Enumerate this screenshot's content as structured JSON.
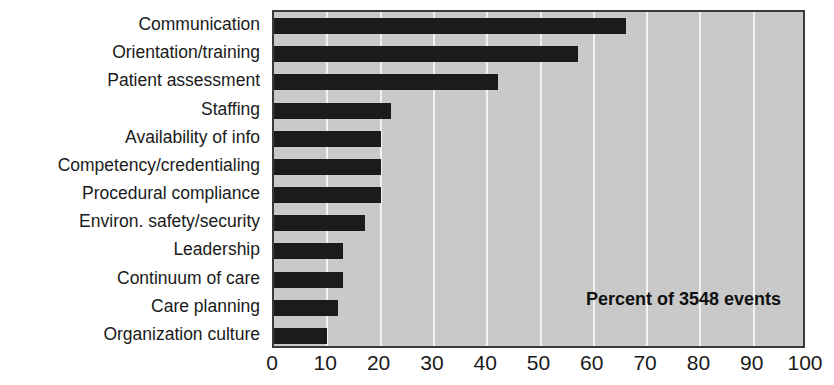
{
  "chart_data": {
    "type": "bar",
    "orientation": "horizontal",
    "title": "",
    "subtitle": "",
    "xlabel": "",
    "ylabel": "",
    "annotation": "Percent of 3548 events",
    "categories": [
      "Communication",
      "Orientation/training",
      "Patient assessment",
      "Staffing",
      "Availability of info",
      "Competency/credentialing",
      "Procedural compliance",
      "Environ. safety/security",
      "Leadership",
      "Continuum of care",
      "Care planning",
      "Organization culture"
    ],
    "values": [
      66,
      57,
      42,
      22,
      20,
      20,
      20,
      17,
      13,
      13,
      12,
      10
    ],
    "xlim": [
      0,
      100
    ],
    "xticks": [
      0,
      10,
      20,
      30,
      40,
      50,
      60,
      70,
      80,
      90,
      100
    ],
    "xticklabels": [
      "0",
      "10",
      "20",
      "30",
      "40",
      "50",
      "60",
      "70",
      "80",
      "90",
      "100"
    ],
    "grid": true,
    "grid_axis": "x",
    "legend": null,
    "colors": {
      "bar": "#1b1b1b",
      "plot_background": "#c9c9c9",
      "gridline": "#f2f2f2",
      "axis_border": "#3a3a3a",
      "text": "#1a1a1a",
      "page_background": "#ffffff"
    }
  }
}
